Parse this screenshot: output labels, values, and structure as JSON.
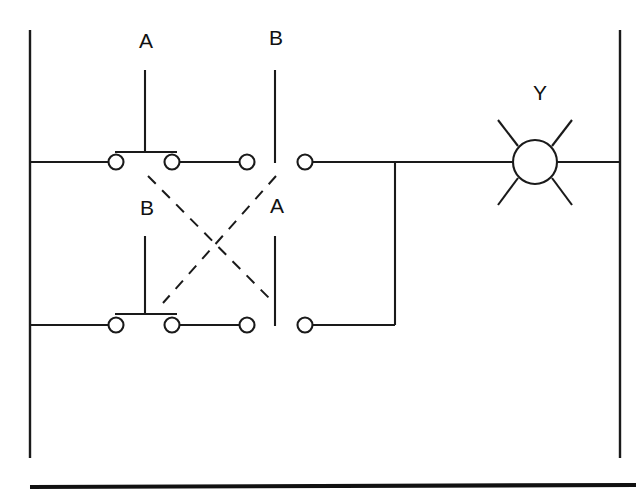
{
  "diagram": {
    "kind": "relay-ladder-xor-circuit",
    "background_color": "#ffffff",
    "line_color": "#1a1a1a",
    "labels": {
      "top_left_switch": "A",
      "top_right_switch": "B",
      "bottom_left_switch": "B",
      "bottom_right_switch": "A",
      "lamp": "Y"
    },
    "rails": {
      "left": {
        "x": 30,
        "y1": 30,
        "y2": 458
      },
      "right": {
        "x": 620,
        "y1": 30,
        "y2": 458
      }
    },
    "rungs": [
      {
        "name": "top-rung",
        "y": 162,
        "x1": 30,
        "x2": 620
      },
      {
        "name": "bottom-rung",
        "y": 325,
        "x1": 30,
        "x2": 395
      }
    ],
    "tie_wire": {
      "x": 395,
      "y1": 162,
      "y2": 325
    },
    "contacts": [
      {
        "name": "top-contact-a-left",
        "cx": 116,
        "cy": 162,
        "r": 7.5
      },
      {
        "name": "top-contact-a-right",
        "cx": 172,
        "cy": 162,
        "r": 7.5
      },
      {
        "name": "top-contact-b-left",
        "cx": 247,
        "cy": 162,
        "r": 7.5
      },
      {
        "name": "top-contact-b-right",
        "cx": 305,
        "cy": 162,
        "r": 7.5
      },
      {
        "name": "bottom-contact-b-left",
        "cx": 116,
        "cy": 325,
        "r": 7.5
      },
      {
        "name": "bottom-contact-b-right",
        "cx": 172,
        "cy": 325,
        "r": 7.5
      },
      {
        "name": "bottom-contact-a-left",
        "cx": 247,
        "cy": 325,
        "r": 7.5
      },
      {
        "name": "bottom-contact-a-right",
        "cx": 305,
        "cy": 325,
        "r": 7.5
      }
    ],
    "switch_stems": [
      {
        "name": "stem-top-a",
        "x": 145,
        "y1": 70,
        "y2": 152,
        "bar_y": 152,
        "bar_x1": 115,
        "bar_x2": 177,
        "state": "open"
      },
      {
        "name": "stem-top-b",
        "x": 275,
        "y1": 70,
        "y2": 163,
        "bar_y": null,
        "state": "closed"
      },
      {
        "name": "stem-bottom-b",
        "x": 145,
        "y1": 236,
        "y2": 314,
        "bar_y": 314,
        "bar_x1": 115,
        "bar_x2": 177,
        "state": "open"
      },
      {
        "name": "stem-bottom-a",
        "x": 275,
        "y1": 236,
        "y2": 326,
        "bar_y": null,
        "state": "closed"
      }
    ],
    "linkages": [
      {
        "name": "linkage-a-top-to-bottom",
        "x1": 148,
        "y1": 176,
        "x2": 272,
        "y2": 301
      },
      {
        "name": "linkage-b-top-to-bottom",
        "x1": 276,
        "y1": 176,
        "x2": 163,
        "y2": 303
      }
    ],
    "lamp": {
      "name": "lamp-y",
      "cx": 535,
      "cy": 162,
      "r": 22,
      "rays": [
        {
          "x1": 518,
          "y1": 146,
          "x2": 498,
          "y2": 120
        },
        {
          "x1": 552,
          "y1": 146,
          "x2": 572,
          "y2": 120
        },
        {
          "x1": 518,
          "y1": 178,
          "x2": 498,
          "y2": 205
        },
        {
          "x1": 552,
          "y1": 178,
          "x2": 572,
          "y2": 205
        }
      ]
    },
    "label_positions": {
      "top_left_switch": {
        "x": 146,
        "y": 48
      },
      "top_right_switch": {
        "x": 276,
        "y": 45
      },
      "bottom_left_switch": {
        "x": 147,
        "y": 215
      },
      "bottom_right_switch": {
        "x": 277,
        "y": 213
      },
      "lamp": {
        "x": 540,
        "y": 100
      }
    },
    "footer_rule": {
      "x1": 30,
      "y1": 487,
      "x2": 636,
      "y2": 485
    }
  }
}
